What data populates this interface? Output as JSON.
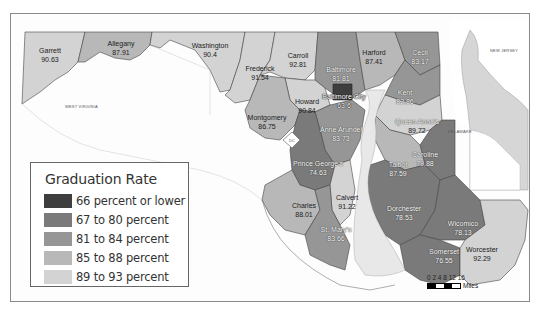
{
  "legend": {
    "title": "Graduation Rate",
    "items": [
      {
        "label": "66 percent or lower",
        "color": "#3e3e3e"
      },
      {
        "label": "67 to 80 percent",
        "color": "#7a7a7a"
      },
      {
        "label": "81 to 84 percent",
        "color": "#969696"
      },
      {
        "label": "85 to 88 percent",
        "color": "#b8b8b8"
      },
      {
        "label": "89 to 93 percent",
        "color": "#d3d3d3"
      }
    ]
  },
  "states": {
    "west_virginia": "WEST VIRGINIA",
    "new_jersey": "NEW JERSEY",
    "delaware": "DELAWARE",
    "dc": "DC"
  },
  "counties": {
    "garrett": {
      "name": "Garrett",
      "value": "90.63"
    },
    "allegany": {
      "name": "Allegany",
      "value": "87.91"
    },
    "washington": {
      "name": "Washington",
      "value": "90.4"
    },
    "frederick": {
      "name": "Frederick",
      "value": "91.54"
    },
    "carroll": {
      "name": "Carroll",
      "value": "92.81"
    },
    "baltimore": {
      "name": "Baltimore",
      "value": "81.81"
    },
    "harford": {
      "name": "Harford",
      "value": "87.41"
    },
    "cecil": {
      "name": "Cecil",
      "value": "83.17"
    },
    "baltimore_city": {
      "name": "Baltimore City",
      "value": "63.6"
    },
    "kent": {
      "name": "Kent",
      "value": "82.86"
    },
    "howard": {
      "name": "Howard",
      "value": "90.84"
    },
    "montgomery": {
      "name": "Montgomery",
      "value": "86.75"
    },
    "anne_arundel": {
      "name": "Anne Arundel",
      "value": "83.73"
    },
    "queen_annes": {
      "name": "Queen Anne's",
      "value": "89.72"
    },
    "caroline": {
      "name": "Caroline",
      "value": "79.88"
    },
    "prince_georges": {
      "name": "Prince George's",
      "value": "74.63"
    },
    "talbot": {
      "name": "Talbot",
      "value": "87.59"
    },
    "calvert": {
      "name": "Calvert",
      "value": "91.22"
    },
    "charles": {
      "name": "Charles",
      "value": "88.01"
    },
    "st_marys": {
      "name": "St. Mary's",
      "value": "83.66"
    },
    "dorchester": {
      "name": "Dorchester",
      "value": "78.53"
    },
    "wicomico": {
      "name": "Wicomico",
      "value": "78.13"
    },
    "somerset": {
      "name": "Somerset",
      "value": "76.55"
    },
    "worcester": {
      "name": "Worcester",
      "value": "92.29"
    }
  },
  "scale": {
    "ticks": "0 2 4   8  12 16",
    "unit": "Miles"
  }
}
